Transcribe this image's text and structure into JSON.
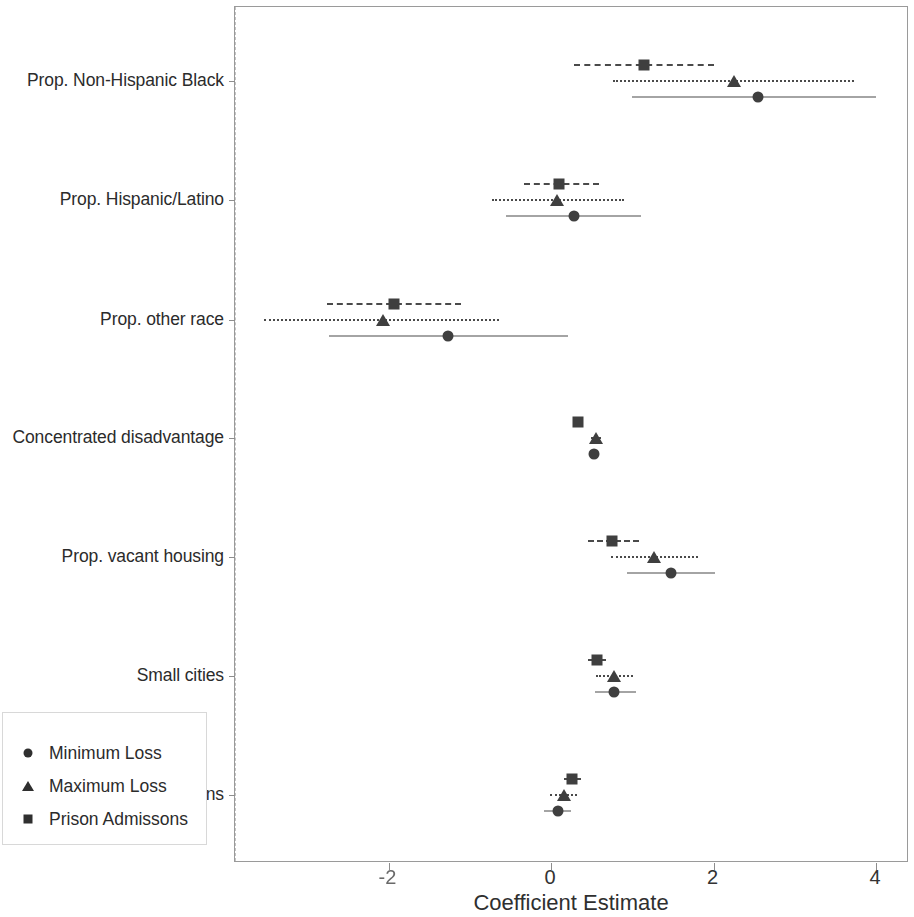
{
  "chart_data": {
    "type": "scatter",
    "subtype": "forest-plot",
    "title": "",
    "xlabel": "Coefficient Estimate",
    "ylabel": "",
    "xlim": [
      -3.89,
      4.41
    ],
    "xticks": [
      -2,
      0,
      2,
      4
    ],
    "xticklabels": [
      "-2",
      "0",
      "2",
      "4"
    ],
    "grid": false,
    "reference_line": {
      "x": 0,
      "style": "dashed",
      "color": "#c2c2c2"
    },
    "legend": {
      "position": "bottom-left",
      "entries": [
        {
          "label": "Minimum Loss",
          "marker": "circle",
          "line": "solid"
        },
        {
          "label": "Maximum Loss",
          "marker": "triangle",
          "line": "dotted"
        },
        {
          "label": "Prison Admissons",
          "marker": "square",
          "line": "dashed"
        }
      ]
    },
    "categories": [
      "Prop. Non-Hispanic Black",
      "Prop. Hispanic/Latino",
      "Prop. other race",
      "Concentrated disadvantage",
      "Prop. vacant housing",
      "Small cities",
      "Suburbs and rural towns"
    ],
    "series": [
      {
        "name": "Prison Admissons",
        "marker": "square",
        "line": "dashed",
        "estimates": [
          1.14,
          0.1,
          -1.93,
          0.33,
          0.75,
          0.57,
          0.26
        ],
        "ci_low": [
          0.28,
          -0.33,
          -2.76,
          0.28,
          0.45,
          0.45,
          0.16
        ],
        "ci_high": [
          2.0,
          0.59,
          -1.11,
          0.38,
          1.08,
          0.68,
          0.37
        ]
      },
      {
        "name": "Maximum Loss",
        "marker": "triangle",
        "line": "dotted",
        "estimates": [
          2.25,
          0.07,
          -2.07,
          0.55,
          1.27,
          0.77,
          0.16
        ],
        "ci_low": [
          0.76,
          -0.73,
          -3.53,
          0.49,
          0.74,
          0.55,
          -0.01
        ],
        "ci_high": [
          3.73,
          0.9,
          -0.64,
          0.62,
          1.81,
          1.01,
          0.32
        ]
      },
      {
        "name": "Minimum Loss",
        "marker": "circle",
        "line": "solid",
        "estimates": [
          2.55,
          0.28,
          -1.27,
          0.53,
          1.48,
          0.78,
          0.08
        ],
        "ci_low": [
          1.0,
          -0.55,
          -2.73,
          0.47,
          0.94,
          0.54,
          -0.09
        ],
        "ci_high": [
          4.0,
          1.11,
          0.21,
          0.59,
          2.02,
          1.05,
          0.25
        ]
      }
    ]
  }
}
